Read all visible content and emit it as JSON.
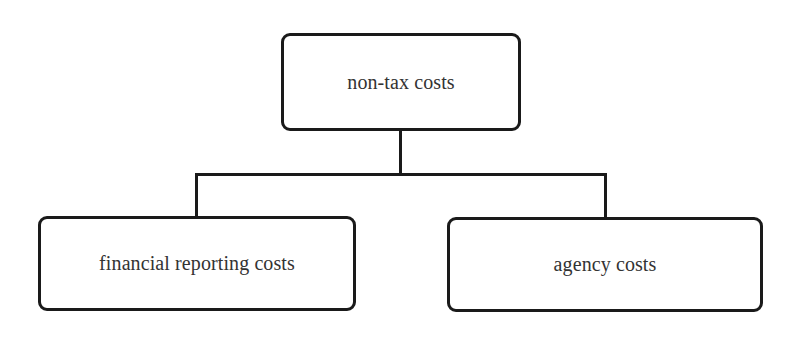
{
  "diagram": {
    "type": "hierarchy-tree",
    "root": {
      "id": "non-tax-costs",
      "label": "non-tax costs"
    },
    "children": [
      {
        "id": "financial-reporting-costs",
        "label": "financial reporting costs"
      },
      {
        "id": "agency-costs",
        "label": "agency costs"
      }
    ],
    "edges": [
      {
        "from": "non-tax-costs",
        "to": "financial-reporting-costs"
      },
      {
        "from": "non-tax-costs",
        "to": "agency-costs"
      }
    ],
    "colors": {
      "border": "#1a1a1a",
      "text": "#333333",
      "background": "#ffffff"
    }
  }
}
